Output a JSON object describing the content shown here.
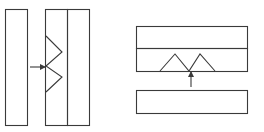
{
  "diagram": {
    "stroke_color": "#3a3a3a",
    "background": "#ffffff",
    "left_figure": {
      "description": "vertical strips with zigzag interface, arrow pointing right",
      "strips": [
        {
          "x": 5,
          "y": 9,
          "w": 22,
          "h": 116
        },
        {
          "x": 45,
          "y": 9,
          "w": 22,
          "h": 116
        },
        {
          "x": 67,
          "y": 9,
          "w": 22,
          "h": 116
        }
      ],
      "zigzag": [
        [
          46,
          36
        ],
        [
          62,
          52
        ],
        [
          46,
          66
        ],
        [
          62,
          77
        ],
        [
          46,
          92
        ]
      ],
      "arrow": {
        "from": [
          30,
          67
        ],
        "to": [
          45,
          67
        ]
      }
    },
    "right_figure": {
      "description": "horizontal strips with triangular peaks, arrow pointing up",
      "strips": [
        {
          "x": 136,
          "y": 26,
          "w": 111,
          "h": 22
        },
        {
          "x": 136,
          "y": 48,
          "w": 111,
          "h": 23
        },
        {
          "x": 136,
          "y": 90,
          "w": 111,
          "h": 23
        }
      ],
      "peaks": [
        [
          160,
          71
        ],
        [
          175,
          54
        ],
        [
          189,
          71
        ],
        [
          200,
          54
        ],
        [
          215,
          71
        ]
      ],
      "arrow": {
        "from": [
          191,
          87
        ],
        "to": [
          191,
          72
        ]
      }
    }
  }
}
